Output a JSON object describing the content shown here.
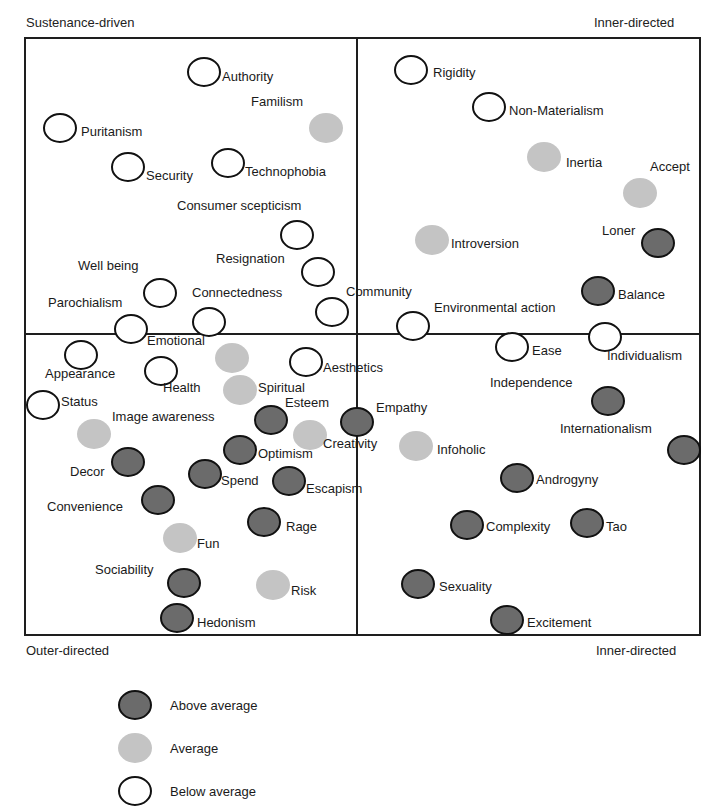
{
  "corners": {
    "top_left": "Sustenance-driven",
    "top_right": "Inner-directed",
    "bottom_left": "Outer-directed",
    "bottom_right": "Inner-directed"
  },
  "colors": {
    "above": "#6b6b6b",
    "average": "#c4c4c4",
    "below": "#ffffff",
    "stroke": "#111111"
  },
  "legend": [
    {
      "category": "above",
      "label": "Above average"
    },
    {
      "category": "average",
      "label": "Average"
    },
    {
      "category": "below",
      "label": "Below average"
    }
  ],
  "points": [
    {
      "label": "Authority",
      "category": "below",
      "x": 204,
      "y": 72,
      "lx": 222,
      "ly": 76
    },
    {
      "label": "Familism",
      "category": "average",
      "x": 326,
      "y": 128,
      "lx": 251,
      "ly": 101
    },
    {
      "label": "Puritanism",
      "category": "below",
      "x": 60,
      "y": 128,
      "lx": 81,
      "ly": 131
    },
    {
      "label": "Security",
      "category": "below",
      "x": 128,
      "y": 167,
      "lx": 146,
      "ly": 175
    },
    {
      "label": "Technophobia",
      "category": "below",
      "x": 228,
      "y": 163,
      "lx": 245,
      "ly": 171
    },
    {
      "label": "Consumer scepticism",
      "category": "below",
      "x": 297,
      "y": 235,
      "lx": 177,
      "ly": 205
    },
    {
      "label": "Resignation",
      "category": "below",
      "x": 318,
      "y": 272,
      "lx": 216,
      "ly": 258
    },
    {
      "label": "Well being",
      "category": "below",
      "x": 160,
      "y": 293,
      "lx": 78,
      "ly": 265
    },
    {
      "label": "Connectedness",
      "category": "below",
      "x": 209,
      "y": 322,
      "lx": 192,
      "ly": 292
    },
    {
      "label": "Community",
      "category": "below",
      "x": 332,
      "y": 312,
      "lx": 346,
      "ly": 291
    },
    {
      "label": "Parochialism",
      "category": "below",
      "x": 131,
      "y": 329,
      "lx": 48,
      "ly": 302
    },
    {
      "label": "Rigidity",
      "category": "below",
      "x": 411,
      "y": 70,
      "lx": 433,
      "ly": 72
    },
    {
      "label": "Non-Materialism",
      "category": "below",
      "x": 489,
      "y": 107,
      "lx": 509,
      "ly": 110
    },
    {
      "label": "Inertia",
      "category": "average",
      "x": 544,
      "y": 157,
      "lx": 566,
      "ly": 162
    },
    {
      "label": "Accept",
      "category": "average",
      "x": 640,
      "y": 193,
      "lx": 650,
      "ly": 166
    },
    {
      "label": "Introversion",
      "category": "average",
      "x": 432,
      "y": 240,
      "lx": 451,
      "ly": 243
    },
    {
      "label": "Loner",
      "category": "above",
      "x": 658,
      "y": 243,
      "lx": 602,
      "ly": 230
    },
    {
      "label": "Balance",
      "category": "above",
      "x": 598,
      "y": 291,
      "lx": 618,
      "ly": 294
    },
    {
      "label": "Environmental action",
      "category": "below",
      "x": 413,
      "y": 326,
      "lx": 434,
      "ly": 307
    },
    {
      "label": "Ease",
      "category": "below",
      "x": 512,
      "y": 347,
      "lx": 532,
      "ly": 350
    },
    {
      "label": "Individualism",
      "category": "below",
      "x": 605,
      "y": 337,
      "lx": 607,
      "ly": 355
    },
    {
      "label": "Emotional",
      "category": "average",
      "x": 232,
      "y": 358,
      "lx": 147,
      "ly": 340
    },
    {
      "label": "Appearance",
      "category": "below",
      "x": 81,
      "y": 355,
      "lx": 45,
      "ly": 373
    },
    {
      "label": "Health",
      "category": "below",
      "x": 161,
      "y": 371,
      "lx": 163,
      "ly": 387
    },
    {
      "label": "Aesthetics",
      "category": "below",
      "x": 306,
      "y": 362,
      "lx": 323,
      "ly": 367
    },
    {
      "label": "Spiritual",
      "category": "average",
      "x": 240,
      "y": 390,
      "lx": 258,
      "ly": 387
    },
    {
      "label": "Status",
      "category": "below",
      "x": 43,
      "y": 405,
      "lx": 61,
      "ly": 401
    },
    {
      "label": "Esteem",
      "category": "above",
      "x": 271,
      "y": 420,
      "lx": 285,
      "ly": 402
    },
    {
      "label": "Empathy",
      "category": "above",
      "x": 357,
      "y": 422,
      "lx": 376,
      "ly": 407
    },
    {
      "label": "Image awareness",
      "category": "average",
      "x": 94,
      "y": 434,
      "lx": 112,
      "ly": 416
    },
    {
      "label": "Creativity",
      "category": "average",
      "x": 310,
      "y": 435,
      "lx": 323,
      "ly": 443
    },
    {
      "label": "Optimism",
      "category": "above",
      "x": 240,
      "y": 450,
      "lx": 258,
      "ly": 453
    },
    {
      "label": "Decor",
      "category": "above",
      "x": 128,
      "y": 462,
      "lx": 70,
      "ly": 471
    },
    {
      "label": "Spend",
      "category": "above",
      "x": 205,
      "y": 474,
      "lx": 221,
      "ly": 480
    },
    {
      "label": "Escapism",
      "category": "above",
      "x": 289,
      "y": 481,
      "lx": 306,
      "ly": 488
    },
    {
      "label": "Convenience",
      "category": "above",
      "x": 158,
      "y": 500,
      "lx": 47,
      "ly": 506
    },
    {
      "label": "Rage",
      "category": "above",
      "x": 264,
      "y": 522,
      "lx": 286,
      "ly": 526
    },
    {
      "label": "Fun",
      "category": "average",
      "x": 180,
      "y": 538,
      "lx": 197,
      "ly": 543
    },
    {
      "label": "Sociability",
      "category": "above",
      "x": 184,
      "y": 583,
      "lx": 95,
      "ly": 569
    },
    {
      "label": "Risk",
      "category": "average",
      "x": 273,
      "y": 585,
      "lx": 291,
      "ly": 590
    },
    {
      "label": "Hedonism",
      "category": "above",
      "x": 177,
      "y": 618,
      "lx": 197,
      "ly": 622
    },
    {
      "label": "Infoholic",
      "category": "average",
      "x": 416,
      "y": 446,
      "lx": 437,
      "ly": 449
    },
    {
      "label": "Independence",
      "category": "above",
      "x": 608,
      "y": 401,
      "lx": 490,
      "ly": 382
    },
    {
      "label": "Internationalism",
      "category": "above",
      "x": 684,
      "y": 450,
      "lx": 560,
      "ly": 428
    },
    {
      "label": "Androgyny",
      "category": "above",
      "x": 517,
      "y": 478,
      "lx": 536,
      "ly": 479
    },
    {
      "label": "Complexity",
      "category": "above",
      "x": 467,
      "y": 525,
      "lx": 486,
      "ly": 526
    },
    {
      "label": "Tao",
      "category": "above",
      "x": 587,
      "y": 523,
      "lx": 606,
      "ly": 526
    },
    {
      "label": "Sexuality",
      "category": "above",
      "x": 418,
      "y": 584,
      "lx": 439,
      "ly": 586
    },
    {
      "label": "Excitement",
      "category": "above",
      "x": 507,
      "y": 620,
      "lx": 527,
      "ly": 622
    }
  ]
}
